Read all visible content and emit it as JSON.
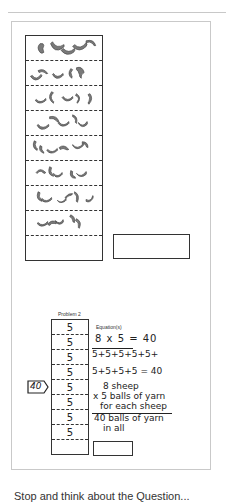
{
  "problem1": {
    "strip_rows": 9,
    "macaroni_rows": 8,
    "macaroni_color": "#777777",
    "answer_box_value": ""
  },
  "problem2": {
    "label": "Problem 2",
    "strip_cells": [
      "5",
      "5",
      "5",
      "5",
      "5",
      "5",
      "5",
      "5",
      ""
    ],
    "total_tag": "40",
    "equations_label": "Equation(s)",
    "equation_1": "8 x 5 = 40",
    "equation_2": "5+5+5+5+5+",
    "equation_3": "5+5+5+5 = 40",
    "word_lines": [
      "8 sheep",
      "x 5 balls of yarn",
      "for each sheep",
      "40 balls of yarn",
      "in all"
    ],
    "answer_box_value": ""
  },
  "footer": {
    "partial_text": "Stop and think about the Question..."
  }
}
